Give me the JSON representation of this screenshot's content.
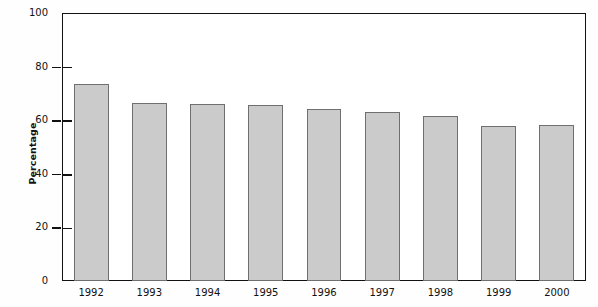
{
  "chart_data": {
    "type": "bar",
    "title": "",
    "subtitle": "",
    "xlabel": "",
    "ylabel": "Percentage",
    "categories": [
      "1992",
      "1993",
      "1994",
      "1995",
      "1996",
      "1997",
      "1998",
      "1999",
      "2000"
    ],
    "values": [
      73.5,
      66.5,
      66,
      65.8,
      64,
      63,
      61.5,
      58,
      58.3
    ],
    "series": [
      {
        "name": "Percentage",
        "values": [
          73.5,
          66.5,
          66,
          65.8,
          64,
          63,
          61.5,
          58,
          58.3
        ]
      }
    ],
    "ylim": [
      0,
      100
    ],
    "ytick_labels": [
      "0",
      "20",
      "40",
      "60",
      "80",
      "100"
    ],
    "ytick_values": [
      0,
      20,
      40,
      60,
      80,
      100
    ],
    "grid": false,
    "legend": null,
    "legend_position": "none",
    "bar_fill_color": "#cbcbcb",
    "bar_border_color": "#6f6f6f",
    "axis_color": "#111111",
    "background_color": "#ffffff"
  }
}
